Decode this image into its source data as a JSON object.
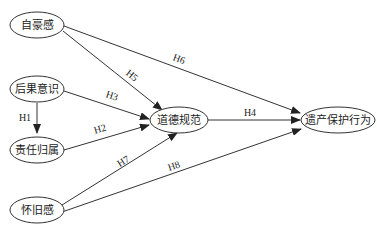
{
  "diagram": {
    "type": "path-model",
    "nodes": [
      {
        "id": "zihao",
        "label": "自豪感"
      },
      {
        "id": "houguo",
        "label": "后果意识"
      },
      {
        "id": "zeren",
        "label": "责任归属"
      },
      {
        "id": "huaijiu",
        "label": "怀旧感"
      },
      {
        "id": "daode",
        "label": "道德规范"
      },
      {
        "id": "yichan",
        "label": "遗产保护行为"
      }
    ],
    "edges": [
      {
        "from": "houguo",
        "to": "zeren",
        "label": "H1"
      },
      {
        "from": "zeren",
        "to": "daode",
        "label": "H2"
      },
      {
        "from": "houguo",
        "to": "daode",
        "label": "H3"
      },
      {
        "from": "daode",
        "to": "yichan",
        "label": "H4"
      },
      {
        "from": "zihao",
        "to": "daode",
        "label": "H5"
      },
      {
        "from": "zihao",
        "to": "yichan",
        "label": "H6"
      },
      {
        "from": "huaijiu",
        "to": "daode",
        "label": "H7"
      },
      {
        "from": "huaijiu",
        "to": "yichan",
        "label": "H8"
      }
    ]
  }
}
